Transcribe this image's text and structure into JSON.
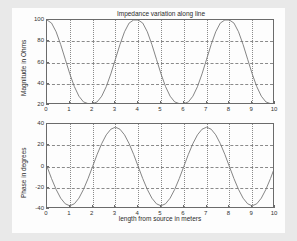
{
  "figure": {
    "background": "#e9e9e9",
    "canvas_background": "#fdfdfd",
    "axis_color": "#6b6b6b",
    "grid_color": "#8a8a8a",
    "curve_color": "#777777"
  },
  "chart_data": [
    {
      "type": "line",
      "name": "magnitude-subplot",
      "title": "Impedance variation along line",
      "xlabel": "",
      "ylabel": "Magnitude in Ohms",
      "xlim": [
        0,
        10
      ],
      "ylim": [
        20,
        100
      ],
      "grid": true,
      "legend": "none",
      "xticks": [
        0,
        1,
        2,
        3,
        4,
        5,
        6,
        7,
        8,
        9,
        10
      ],
      "xticklabels": [
        "0",
        "1",
        "2",
        "3",
        "4",
        "5",
        "6",
        "7",
        "8",
        "9",
        "10"
      ],
      "yticks": [
        20,
        40,
        60,
        80,
        100
      ],
      "yticklabels": [
        "20",
        "40",
        "60",
        "80",
        "100"
      ],
      "series": [
        {
          "name": "magnitude",
          "x": [
            0,
            0.2,
            0.4,
            0.6,
            0.8,
            1,
            1.2,
            1.4,
            1.6,
            1.8,
            2,
            2.2,
            2.4,
            2.6,
            2.8,
            3,
            3.2,
            3.4,
            3.6,
            3.8,
            4,
            4.2,
            4.4,
            4.6,
            4.8,
            5,
            5.2,
            5.4,
            5.6,
            5.8,
            6,
            6.2,
            6.4,
            6.6,
            6.8,
            7,
            7.2,
            7.4,
            7.6,
            7.8,
            8,
            8.2,
            8.4,
            8.6,
            8.8,
            9,
            9.2,
            9.4,
            9.6,
            9.8,
            10
          ],
          "y": [
            100,
            97.1,
            88.9,
            76.9,
            63.1,
            49.3,
            37.3,
            28.3,
            22.9,
            21.3,
            21.3,
            22.9,
            28.3,
            37.3,
            49.3,
            63.1,
            76.9,
            88.9,
            97.1,
            100,
            100,
            97.1,
            88.9,
            76.9,
            63.1,
            49.3,
            37.3,
            28.3,
            22.9,
            21.3,
            21.3,
            22.9,
            28.3,
            37.3,
            49.3,
            63.1,
            76.9,
            88.9,
            97.1,
            100,
            100,
            97.1,
            88.9,
            76.9,
            63.1,
            49.3,
            37.3,
            28.3,
            22.9,
            21.3,
            21.3
          ]
        }
      ],
      "description": "Magnitude oscillates between about 25 and 100 ohms with period 4 meters; maxima at 0, 4 and 8 m, minima at 2, 6 and 10 m."
    },
    {
      "type": "line",
      "name": "phase-subplot",
      "title": "",
      "xlabel": "length from source in meters",
      "ylabel": "Phase in degrees",
      "xlim": [
        0,
        10
      ],
      "ylim": [
        -40,
        40
      ],
      "grid": true,
      "legend": "none",
      "xticks": [
        0,
        1,
        2,
        3,
        4,
        5,
        6,
        7,
        8,
        9,
        10
      ],
      "xticklabels": [
        "0",
        "1",
        "2",
        "3",
        "4",
        "5",
        "6",
        "7",
        "8",
        "9",
        "10"
      ],
      "yticks": [
        -40,
        -20,
        0,
        20,
        40
      ],
      "yticklabels": [
        "-40",
        "-20",
        "0",
        "20",
        "40"
      ],
      "series": [
        {
          "name": "phase",
          "x": [
            0,
            0.2,
            0.4,
            0.6,
            0.8,
            1,
            1.2,
            1.4,
            1.6,
            1.8,
            2,
            2.2,
            2.4,
            2.6,
            2.8,
            3,
            3.2,
            3.4,
            3.6,
            3.8,
            4,
            4.2,
            4.4,
            4.6,
            4.8,
            5,
            5.2,
            5.4,
            5.6,
            5.8,
            6,
            6.2,
            6.4,
            6.6,
            6.8,
            7,
            7.2,
            7.4,
            7.6,
            7.8,
            8,
            8.2,
            8.4,
            8.6,
            8.8,
            9,
            9.2,
            9.4,
            9.6,
            9.8,
            10
          ],
          "y": [
            0,
            -11.4,
            -21.6,
            -29.8,
            -35.1,
            -37.0,
            -35.1,
            -29.8,
            -21.6,
            -11.4,
            0,
            11.4,
            21.6,
            29.8,
            35.1,
            37.0,
            35.1,
            29.8,
            21.6,
            11.4,
            0,
            -11.4,
            -21.6,
            -29.8,
            -35.1,
            -37.0,
            -35.1,
            -29.8,
            -21.6,
            -11.4,
            0,
            11.4,
            21.6,
            29.8,
            35.1,
            37.0,
            35.1,
            29.8,
            21.6,
            11.4,
            0,
            -11.4,
            -21.6,
            -29.8,
            -35.1,
            -37.0,
            -35.1,
            -29.8,
            -21.6,
            -11.4,
            0
          ]
        }
      ],
      "description": "Phase is a sinusoid of amplitude about 37 degrees and period 4 meters; zero at 0, 2, 4, 6, 8 and 10 m, minima at 1, 5 and 9 m, maxima at 3 and 7 m."
    }
  ]
}
